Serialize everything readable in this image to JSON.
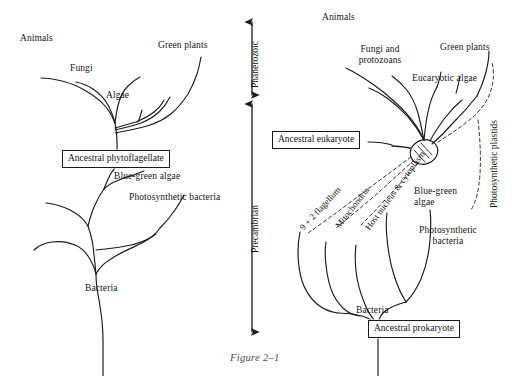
{
  "figure": {
    "caption": "Figure 2–1"
  },
  "timeline": {
    "eras": [
      {
        "name": "Phanerozoic",
        "label": "Phanerozoic"
      },
      {
        "name": "Precambrian",
        "label": "Precambrian"
      }
    ]
  },
  "left_tree": {
    "name": "classical-phylogenetic-tree",
    "root_label": "Bacteria",
    "box_label": "Ancestral phytoflagellate",
    "tips": [
      {
        "label": "Animals"
      },
      {
        "label": "Fungi"
      },
      {
        "label": "Algae"
      },
      {
        "label": "Green plants"
      },
      {
        "label": "Blue-green algae"
      },
      {
        "label": "Photosynthetic bacteria"
      }
    ]
  },
  "right_tree": {
    "name": "endosymbiotic-phylogenetic-tree",
    "root_box_label": "Ancestral prokaryote",
    "root_label": "Bacteria",
    "eukaryote_box_label": "Ancestral eukaryote",
    "tips": [
      {
        "label": "Animals"
      },
      {
        "label": "Fungi and protozoans"
      },
      {
        "label": "Eucaryotic algae"
      },
      {
        "label": "Green plants"
      },
      {
        "label": "Blue-green algae"
      },
      {
        "label": "Photosynthetic bacteria"
      }
    ],
    "symbiont_contributions": [
      {
        "label": "9 + 2 flagellum"
      },
      {
        "label": "Mitochondria"
      },
      {
        "label": "Host nucleus & cytoplasm"
      }
    ],
    "plastid_label": "Photosynthetic plastids"
  },
  "colors": {
    "ink": "#1a1a1a",
    "caption": "#4a4a4a",
    "background": "#ffffff"
  }
}
